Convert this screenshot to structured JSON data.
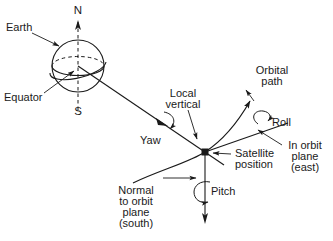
{
  "figure": {
    "type": "technical-line-diagram",
    "background_color": "#ffffff",
    "line_color": "#1a1a1a",
    "text_color": "#1a1a1a"
  },
  "labels": {
    "earth": "Earth",
    "equator": "Equator",
    "north_pole": "N",
    "south_pole": "S",
    "local_vertical_line1": "Local",
    "local_vertical_line2": "vertical",
    "orbital_path_line1": "Orbital",
    "orbital_path_line2": "path",
    "yaw": "Yaw",
    "roll": "Roll",
    "pitch": "Pitch",
    "satellite_position_line1": "Satellite",
    "satellite_position_line2": "position",
    "in_orbit_plane_line1": "In orbit",
    "in_orbit_plane_line2": "plane",
    "in_orbit_plane_line3": "(east)",
    "normal_line1": "Normal",
    "normal_line2": "to orbit",
    "normal_line3": "plane",
    "normal_line4": "(south)"
  },
  "axes": [
    {
      "name": "yaw",
      "label": "Yaw",
      "direction": "local vertical, toward Earth nadir",
      "rotation_symbol": "curved-arrow"
    },
    {
      "name": "roll",
      "label": "Roll",
      "direction": "in orbit plane (east), along velocity",
      "rotation_symbol": "curved-arrow"
    },
    {
      "name": "pitch",
      "label": "Pitch",
      "direction": "normal to orbit plane (south)",
      "rotation_symbol": "circular-arrow"
    }
  ],
  "geometry": {
    "earth_center": [
      78,
      66
    ],
    "earth_radius": 26,
    "satellite_position": [
      205,
      152
    ],
    "polar_axis": "dashed vertical through Earth center",
    "equator": "ellipse, dashed on far half"
  }
}
